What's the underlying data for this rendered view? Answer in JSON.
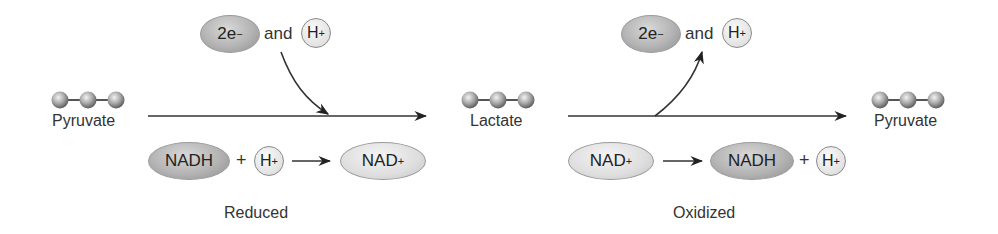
{
  "diagram": {
    "type": "reaction-diagram",
    "molecules": [
      {
        "label": "Pyruvate",
        "position": "left"
      },
      {
        "label": "Lactate",
        "position": "center"
      },
      {
        "label": "Pyruvate",
        "position": "right"
      }
    ],
    "left_step": {
      "electron_label": "2e",
      "electron_charge": "−",
      "connector": "and",
      "proton_label": "H",
      "proton_charge": "+",
      "arrow_direction": "in",
      "cofactor_from": "NADH",
      "plus": "+",
      "cofactor_from_proton": "H",
      "cofactor_from_proton_charge": "+",
      "cofactor_to": "NAD",
      "cofactor_to_charge": "+",
      "caption": "Reduced"
    },
    "right_step": {
      "electron_label": "2e",
      "electron_charge": "−",
      "connector": "and",
      "proton_label": "H",
      "proton_charge": "+",
      "arrow_direction": "out",
      "cofactor_from": "NAD",
      "cofactor_from_charge": "+",
      "cofactor_to": "NADH",
      "plus": "+",
      "cofactor_to_proton": "H",
      "cofactor_to_proton_charge": "+",
      "caption": "Oxidized"
    },
    "colors": {
      "arrow": "#222222",
      "dark_oval": "#b4b4b4",
      "light_oval": "#dedede",
      "text": "#333333"
    }
  }
}
